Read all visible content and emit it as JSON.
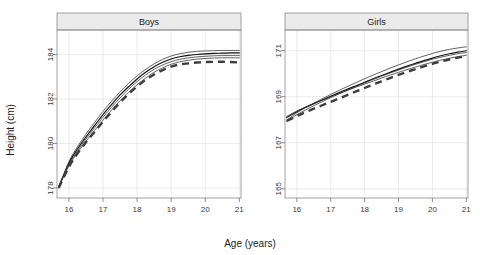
{
  "chart_data": {
    "type": "line",
    "title": "",
    "xlabel": "Age (years)",
    "ylabel": "Height (cm)",
    "grid": true,
    "legend": "none",
    "panel_layout": "1 row x 2 columns",
    "panels": [
      {
        "strip_label": "Boys",
        "xlabel": "Age (years)",
        "ylabel": "Height (cm)",
        "xlim": [
          15.65,
          21.05
        ],
        "ylim": [
          177.55,
          185.1
        ],
        "xticks": [
          16,
          17,
          18,
          19,
          20,
          21
        ],
        "xtick_labels": [
          "16",
          "17",
          "18",
          "19",
          "20",
          "21"
        ],
        "yticks": [
          178,
          180,
          182,
          184
        ],
        "ytick_labels": [
          "178",
          "180",
          "182",
          "184"
        ],
        "x": [
          15.7,
          16.0,
          16.25,
          16.5,
          16.75,
          17.0,
          17.25,
          17.5,
          17.75,
          18.0,
          18.25,
          18.5,
          18.75,
          19.0,
          19.25,
          19.5,
          19.75,
          20.0,
          20.25,
          20.5,
          20.75,
          21.0
        ],
        "series": [
          {
            "name": "model-curve-1",
            "style": "solid-thick",
            "values": [
              178.05,
              179.12,
              179.75,
              180.3,
              180.8,
              181.3,
              181.75,
              182.18,
              182.55,
              182.9,
              183.2,
              183.45,
              183.65,
              183.8,
              183.9,
              183.96,
              184.0,
              184.03,
              184.05,
              184.06,
              184.07,
              184.07
            ]
          },
          {
            "name": "model-curve-2",
            "style": "solid-thin",
            "values": [
              178.0,
              179.18,
              179.85,
              180.42,
              180.94,
              181.44,
              181.9,
              182.32,
              182.7,
              183.04,
              183.33,
              183.58,
              183.78,
              183.93,
              184.03,
              184.1,
              184.14,
              184.16,
              184.17,
              184.18,
              184.18,
              184.18
            ]
          },
          {
            "name": "model-curve-3",
            "style": "solid-thin",
            "values": [
              178.08,
              179.05,
              179.66,
              180.2,
              180.7,
              181.18,
              181.63,
              182.05,
              182.44,
              182.78,
              183.08,
              183.33,
              183.53,
              183.68,
              183.78,
              183.85,
              183.89,
              183.92,
              183.94,
              183.95,
              183.95,
              183.95
            ]
          },
          {
            "name": "model-curve-4",
            "style": "solid-thin",
            "values": [
              178.02,
              179.0,
              179.58,
              180.1,
              180.58,
              181.05,
              181.5,
              181.92,
              182.3,
              182.64,
              182.94,
              183.2,
              183.4,
              183.56,
              183.67,
              183.74,
              183.79,
              183.82,
              183.84,
              183.85,
              183.85,
              183.85
            ]
          },
          {
            "name": "observed-mean-dashed",
            "style": "dashed",
            "values": [
              178.0,
              178.95,
              179.55,
              180.05,
              180.52,
              180.98,
              181.42,
              181.84,
              182.22,
              182.56,
              182.86,
              183.1,
              183.3,
              183.45,
              183.55,
              183.6,
              183.64,
              183.66,
              183.67,
              183.67,
              183.66,
              183.64
            ]
          }
        ]
      },
      {
        "strip_label": "Girls",
        "xlabel": "Age (years)",
        "ylabel": "Height (cm)",
        "xlim": [
          15.65,
          21.05
        ],
        "ylim": [
          164.6,
          171.9
        ],
        "xticks": [
          16,
          17,
          18,
          19,
          20,
          21
        ],
        "xtick_labels": [
          "16",
          "17",
          "18",
          "19",
          "20",
          "21"
        ],
        "yticks": [
          165,
          167,
          169,
          171
        ],
        "ytick_labels": [
          "165",
          "167",
          "169",
          "171"
        ],
        "x": [
          15.7,
          16.0,
          16.25,
          16.5,
          16.75,
          17.0,
          17.25,
          17.5,
          17.75,
          18.0,
          18.25,
          18.5,
          18.75,
          19.0,
          19.25,
          19.5,
          19.75,
          20.0,
          20.25,
          20.5,
          20.75,
          21.0
        ],
        "series": [
          {
            "name": "model-curve-1",
            "style": "solid-thick",
            "values": [
              168.1,
              168.35,
              168.53,
              168.7,
              168.86,
              169.02,
              169.18,
              169.33,
              169.48,
              169.63,
              169.78,
              169.92,
              170.06,
              170.2,
              170.33,
              170.45,
              170.57,
              170.68,
              170.78,
              170.87,
              170.94,
              171.0
            ]
          },
          {
            "name": "model-curve-2",
            "style": "solid-thin",
            "values": [
              167.98,
              168.3,
              168.52,
              168.72,
              168.91,
              169.1,
              169.28,
              169.45,
              169.62,
              169.78,
              169.94,
              170.09,
              170.24,
              170.38,
              170.52,
              170.65,
              170.77,
              170.88,
              170.98,
              171.06,
              171.12,
              171.17
            ]
          },
          {
            "name": "model-curve-3",
            "style": "solid-thin",
            "values": [
              168.14,
              168.38,
              168.55,
              168.71,
              168.86,
              169.0,
              169.14,
              169.28,
              169.42,
              169.55,
              169.68,
              169.81,
              169.94,
              170.06,
              170.18,
              170.29,
              170.4,
              170.5,
              170.59,
              170.67,
              170.74,
              170.8
            ]
          },
          {
            "name": "model-curve-4",
            "style": "solid-thin",
            "values": [
              167.92,
              168.22,
              168.42,
              168.61,
              168.79,
              168.96,
              169.13,
              169.29,
              169.45,
              169.6,
              169.75,
              169.89,
              170.03,
              170.16,
              170.29,
              170.41,
              170.52,
              170.63,
              170.72,
              170.8,
              170.87,
              170.92
            ]
          },
          {
            "name": "observed-mean-dashed",
            "style": "dashed",
            "values": [
              167.95,
              168.16,
              168.32,
              168.48,
              168.63,
              168.78,
              168.93,
              169.08,
              169.23,
              169.38,
              169.53,
              169.67,
              169.81,
              169.95,
              170.08,
              170.2,
              170.32,
              170.43,
              170.53,
              170.62,
              170.7,
              170.77
            ]
          }
        ]
      }
    ]
  },
  "colors": {
    "background": "#ffffff",
    "strip_fill": "#ebebeb",
    "frame": "#8a8a8a",
    "grid": "#dedede",
    "curve_solid": "#111111",
    "curve_dashed": "#3d3d3d",
    "text": "#1a1a1a"
  }
}
